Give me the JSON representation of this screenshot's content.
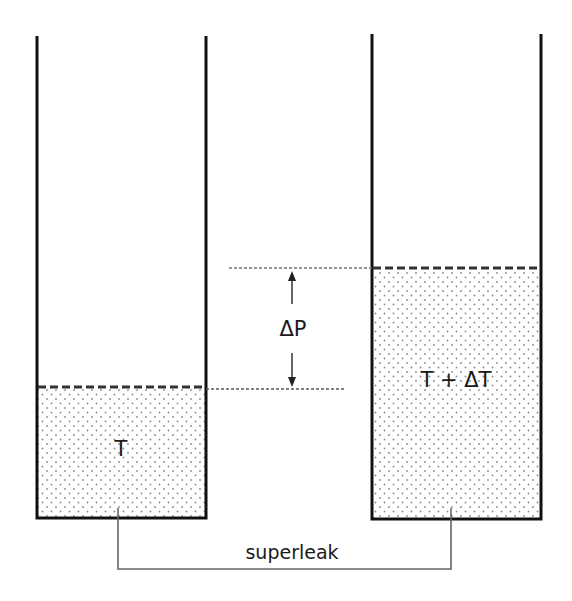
{
  "diagram": {
    "left_vessel": {
      "label": "T",
      "liquid_level_y": 387
    },
    "right_vessel": {
      "label": "T + ΔT",
      "liquid_level_y": 268
    },
    "pressure_difference": {
      "label": "ΔP"
    },
    "connector": {
      "label": "superleak"
    }
  },
  "colors": {
    "wall": "#111111",
    "dash": "#333333",
    "guide": "#777777",
    "dot": "#8a8a8a",
    "pipe": "#666666"
  }
}
